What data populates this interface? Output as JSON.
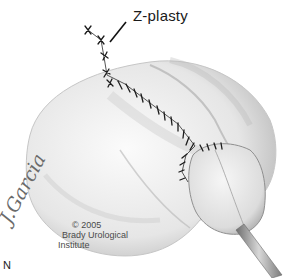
{
  "figure": {
    "callout_label": "Z-plasty",
    "panel_letter": "N",
    "signature": "J.Garcia",
    "copyright": {
      "year_line": "© 2005",
      "org_line_1": "Brady Urological",
      "org_line_2": "Institute"
    },
    "colors": {
      "skin_light": "#f2f2f2",
      "skin_shadow": "#bdbdbd",
      "suture": "#1c1c1c",
      "catheter": "#9a9a9a"
    }
  }
}
